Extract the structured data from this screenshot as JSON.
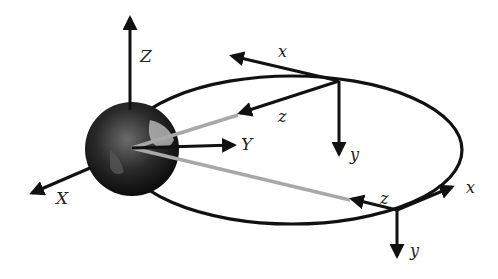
{
  "diagram": {
    "title": "",
    "inertial_frame": {
      "axes": [
        {
          "label": "Z",
          "direction": "up"
        },
        {
          "label": "Y",
          "direction": "right"
        },
        {
          "label": "X",
          "direction": "down-left"
        }
      ],
      "origin": "Earth center"
    },
    "orbit": {
      "shape": "ellipse"
    },
    "body_frames": [
      {
        "position": "top of orbit",
        "axes": [
          {
            "label": "x",
            "direction": "along-track (left)"
          },
          {
            "label": "z",
            "direction": "toward Earth"
          },
          {
            "label": "y",
            "direction": "down"
          }
        ]
      },
      {
        "position": "lower-right of orbit",
        "axes": [
          {
            "label": "x",
            "direction": "along-track (right)"
          },
          {
            "label": "z",
            "direction": "toward Earth"
          },
          {
            "label": "y",
            "direction": "down"
          }
        ]
      }
    ],
    "colors": {
      "axis": "#111111",
      "radius_line": "#a8a8a8",
      "earth": "#2a2a2a"
    }
  }
}
